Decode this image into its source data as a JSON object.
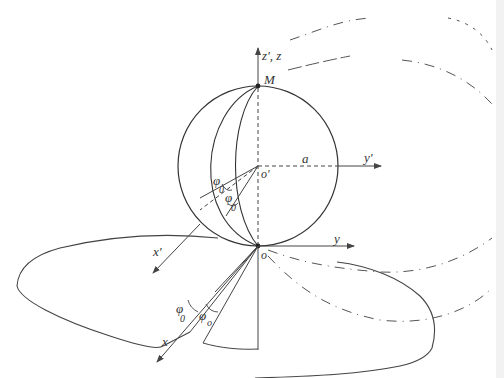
{
  "diagram": {
    "labels": {
      "z_axis": "z', z",
      "point_m": "M",
      "origin_prime": "o'",
      "radius": "a",
      "y_prime": "y'",
      "y": "y",
      "origin": "o",
      "x_prime": "x'",
      "x": "x",
      "phi0_upper_1": "φ",
      "phi0_upper_1_sub": "0",
      "phi0_upper_2": "φ",
      "phi0_upper_2_sub": "0",
      "phi0_lower_1": "φ",
      "phi0_lower_1_sub": "0",
      "phi0_lower_2": "φ",
      "phi0_lower_2_sub": "o"
    },
    "colors": {
      "line": "#333333",
      "dash": "#555555"
    }
  }
}
